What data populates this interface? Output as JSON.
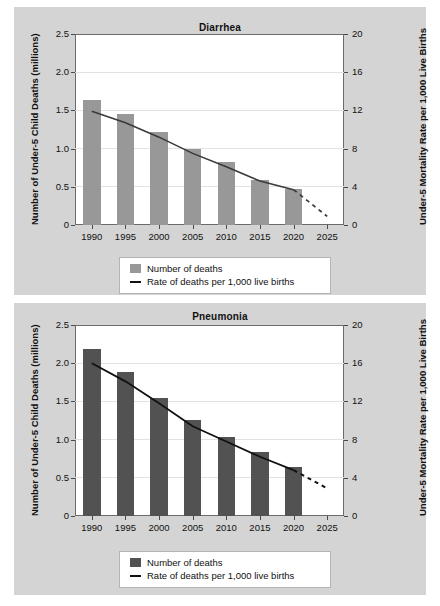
{
  "charts": [
    {
      "id": "diarrhea",
      "title": "Diarrhea",
      "ylabel": "Number of Under-5 Child Deaths (millions)",
      "y2label": "Under-5 Mortality Rate per 1,000 Live Births",
      "yticks": [
        "2.5",
        "2.0",
        "1.5",
        "1.0",
        "0.5",
        "0"
      ],
      "y2ticks": [
        "20",
        "16",
        "12",
        "8",
        "4",
        "0"
      ],
      "xticks": [
        "1990",
        "1995",
        "2000",
        "2005",
        "2010",
        "2015",
        "2020",
        "2025"
      ],
      "legend": {
        "bars_label": "Number of deaths",
        "line_label": "Rate of deaths per 1,000 live births"
      },
      "bar_color": "#989898",
      "line_color": "#3a3a3a"
    },
    {
      "id": "pneumonia",
      "title": "Pneumonia",
      "ylabel": "Number of Under-5 Child Deaths (millions)",
      "y2label": "Under-5 Mortality Rate per 1,000 Live Births",
      "yticks": [
        "2.5",
        "2.0",
        "1.5",
        "1.0",
        "0.5",
        "0"
      ],
      "y2ticks": [
        "20",
        "16",
        "12",
        "8",
        "4",
        "0"
      ],
      "xticks": [
        "1990",
        "1995",
        "2000",
        "2005",
        "2010",
        "2015",
        "2020",
        "2025"
      ],
      "legend": {
        "bars_label": "Number of deaths",
        "line_label": "Rate of deaths per 1,000 live births"
      },
      "bar_color": "#525252",
      "line_color": "#111111"
    }
  ],
  "chart_data": [
    {
      "type": "bar",
      "title": "Diarrhea",
      "xlabel": "",
      "ylabel": "Number of Under-5 Child Deaths (millions)",
      "y2label": "Under-5 Mortality Rate per 1,000 Live Births",
      "categories": [
        "1990",
        "1995",
        "2000",
        "2005",
        "2010",
        "2015",
        "2020",
        "2025"
      ],
      "ylim": [
        0,
        2.5
      ],
      "y2lim": [
        0,
        20
      ],
      "yticks": [
        0,
        0.5,
        1.0,
        1.5,
        2.0,
        2.5
      ],
      "y2ticks": [
        0,
        4,
        8,
        12,
        16,
        20
      ],
      "grid": true,
      "legend_position": "below-plot",
      "series": [
        {
          "name": "Number of deaths",
          "kind": "bar",
          "unit": "millions",
          "values": [
            1.63,
            1.45,
            1.22,
            1.0,
            0.82,
            0.59,
            0.47,
            null
          ]
        },
        {
          "name": "Rate of deaths per 1,000 live births",
          "kind": "line",
          "unit": "per 1,000 live births",
          "axis": "right",
          "values": [
            11.9,
            10.7,
            9.2,
            7.5,
            6.1,
            4.6,
            3.7,
            0.9
          ],
          "solid_through": "2020",
          "dashed_from": "2020",
          "dashed_note": "projection 2020 to 2025"
        }
      ]
    },
    {
      "type": "bar",
      "title": "Pneumonia",
      "xlabel": "",
      "ylabel": "Number of Under-5 Child Deaths (millions)",
      "y2label": "Under-5 Mortality Rate per 1,000 Live Births",
      "categories": [
        "1990",
        "1995",
        "2000",
        "2005",
        "2010",
        "2015",
        "2020",
        "2025"
      ],
      "ylim": [
        0,
        2.5
      ],
      "y2lim": [
        0,
        20
      ],
      "yticks": [
        0,
        0.5,
        1.0,
        1.5,
        2.0,
        2.5
      ],
      "y2ticks": [
        0,
        4,
        8,
        12,
        16,
        20
      ],
      "grid": true,
      "legend_position": "below-plot",
      "series": [
        {
          "name": "Number of deaths",
          "kind": "bar",
          "unit": "millions",
          "values": [
            2.19,
            1.88,
            1.54,
            1.26,
            1.03,
            0.84,
            0.64,
            null
          ]
        },
        {
          "name": "Rate of deaths per 1,000 live births",
          "kind": "line",
          "unit": "per 1,000 live births",
          "axis": "right",
          "values": [
            16.0,
            14.1,
            11.8,
            9.4,
            7.8,
            6.2,
            4.8,
            2.9
          ],
          "solid_through": "2020",
          "dashed_from": "2020",
          "dashed_note": "projection 2020 to 2025"
        }
      ]
    }
  ]
}
